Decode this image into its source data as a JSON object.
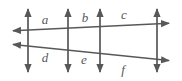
{
  "figure": {
    "type": "geometry-diagram",
    "width": 182,
    "height": 81,
    "background_color": "#ffffff",
    "line_color": "#58585a",
    "label_color": "#58585a",
    "vertical_lines": [
      {
        "name": "vertical-line-1",
        "x": 28,
        "y_top": 5,
        "y_bottom": 76,
        "arrows": "both"
      },
      {
        "name": "vertical-line-2",
        "x": 68,
        "y_top": 5,
        "y_bottom": 76,
        "arrows": "both"
      },
      {
        "name": "vertical-line-3",
        "x": 100,
        "y_top": 5,
        "y_bottom": 76,
        "arrows": "both"
      },
      {
        "name": "vertical-line-4",
        "x": 157,
        "y_top": 5,
        "y_bottom": 76,
        "arrows": "both"
      }
    ],
    "transversals": [
      {
        "name": "transversal-upper",
        "x1": 9,
        "y1": 31,
        "x2": 173,
        "y2": 23,
        "arrows": "both"
      },
      {
        "name": "transversal-lower",
        "x1": 9,
        "y1": 44,
        "x2": 173,
        "y2": 61,
        "arrows": "both"
      }
    ],
    "labels": [
      {
        "id": "a",
        "text": "a",
        "x": 45,
        "y": 24
      },
      {
        "id": "b",
        "text": "b",
        "x": 85,
        "y": 22
      },
      {
        "id": "c",
        "text": "c",
        "x": 124,
        "y": 19
      },
      {
        "id": "d",
        "text": "d",
        "x": 45,
        "y": 62
      },
      {
        "id": "e",
        "text": "e",
        "x": 84,
        "y": 64
      },
      {
        "id": "f",
        "text": "f",
        "x": 123,
        "y": 74
      }
    ]
  }
}
